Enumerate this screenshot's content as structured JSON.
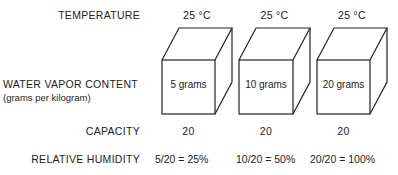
{
  "labels": {
    "temperature": "TEMPERATURE",
    "water_vapor": "WATER VAPOR CONTENT",
    "water_vapor_unit": "(grams per kilogram)",
    "capacity": "CAPACITY",
    "relative_humidity": "RELATIVE HUMIDITY"
  },
  "columns": [
    {
      "temperature": "25 °C",
      "content": "5 grams",
      "capacity": "20",
      "rh": "5/20 = 25%"
    },
    {
      "temperature": "25 °C",
      "content": "10 grams",
      "capacity": "20",
      "rh": "10/20 = 50%"
    },
    {
      "temperature": "25 °C",
      "content": "20 grams",
      "capacity": "20",
      "rh": "20/20 = 100%"
    }
  ]
}
